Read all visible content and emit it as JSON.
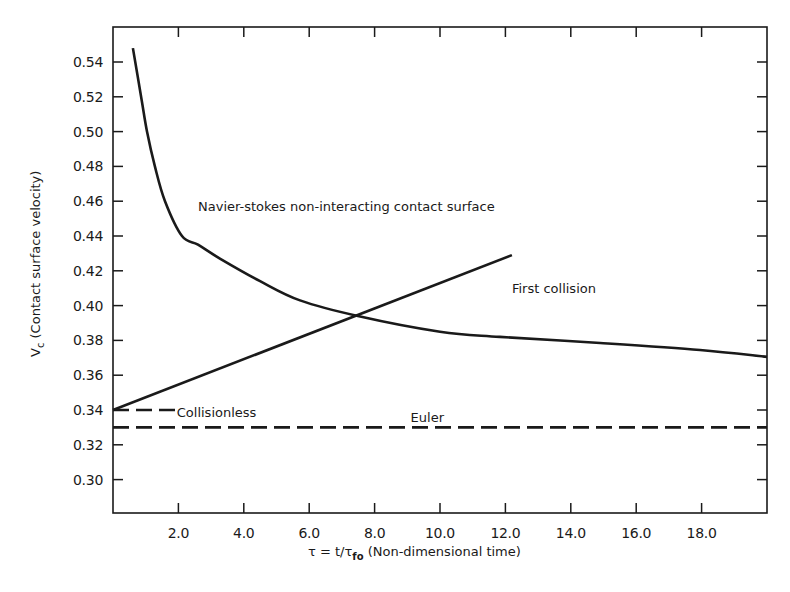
{
  "chart_data": {
    "type": "line",
    "title": "",
    "xlabel": "τ = t/τ_fo (Non-dimensional time)",
    "xlabel_parts": {
      "main": "τ = t/τ",
      "subscript": "fo",
      "rest": " (Non-dimensional time)"
    },
    "ylabel": "V_c (Contact surface velocity)",
    "ylabel_parts": {
      "main": "V",
      "subscript": "c",
      "rest": " (Contact surface velocity)"
    },
    "xlim": [
      0,
      20
    ],
    "ylim": [
      0.28,
      0.56
    ],
    "grid": false,
    "legend": "none (inline annotations)",
    "x_ticks": [
      2,
      4,
      6,
      8,
      10,
      12,
      14,
      16,
      18
    ],
    "x_tick_labels": [
      "2.0",
      "4.0",
      "6.0",
      "8.0",
      "10.0",
      "12.0",
      "14.0",
      "16.0",
      "18.0"
    ],
    "y_ticks": [
      0.3,
      0.32,
      0.34,
      0.36,
      0.38,
      0.4,
      0.42,
      0.44,
      0.46,
      0.48,
      0.5,
      0.52,
      0.54
    ],
    "y_tick_labels": [
      "0.30",
      "0.32",
      "0.34",
      "0.36",
      "0.38",
      "0.40",
      "0.42",
      "0.44",
      "0.46",
      "0.48",
      "0.50",
      "0.52",
      "0.54"
    ],
    "series": [
      {
        "name": "Navier-stokes non-interacting contact surface",
        "style": "solid",
        "x": [
          0.61,
          0.86,
          1.04,
          1.28,
          1.59,
          2.11,
          2.6,
          3.27,
          4.5,
          5.72,
          7.49,
          10.0,
          11.83,
          14.9,
          17.95,
          20.0
        ],
        "y": [
          0.548,
          0.52,
          0.5,
          0.48,
          0.46,
          0.44,
          0.435,
          0.427,
          0.414,
          0.403,
          0.394,
          0.385,
          0.382,
          0.3785,
          0.3745,
          0.3705
        ]
      },
      {
        "name": "First collision",
        "style": "solid",
        "x": [
          0.0,
          12.2
        ],
        "y": [
          0.34,
          0.429
        ]
      },
      {
        "name": "Collisionless",
        "style": "dashed",
        "x": [
          0.0,
          1.9
        ],
        "y": [
          0.34,
          0.34
        ]
      },
      {
        "name": "Euler",
        "style": "dashed",
        "x": [
          0.0,
          20.0
        ],
        "y": [
          0.33,
          0.33
        ]
      }
    ],
    "annotations": [
      {
        "text": "Navier-stokes non-interacting contact surface",
        "x": 2.6,
        "y": 0.457
      },
      {
        "text": "First collision",
        "x": 12.2,
        "y": 0.41
      },
      {
        "text": "Collisionless",
        "x": 1.95,
        "y": 0.339
      },
      {
        "text": "Euler",
        "x": 9.1,
        "y": 0.333
      }
    ]
  },
  "colors": {
    "line": "#1a1a1a",
    "background": "#ffffff"
  }
}
